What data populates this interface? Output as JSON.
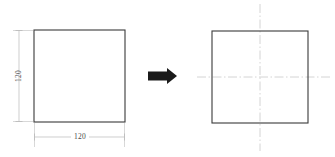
{
  "drawing": {
    "title": "Square plate dimension to centerline transformation",
    "colors": {
      "outline": "#3a3a3a",
      "dimension_line": "#b9b9b9",
      "extension_line": "#c7c7c7",
      "centerline": "#c9c9c9",
      "arrow": "#1a1a1a",
      "text": "#4a4a4a",
      "background": "#ffffff"
    },
    "left_view": {
      "name": "dimensioned-square",
      "shape": "square",
      "width_dimension": {
        "value": "120",
        "orientation": "horizontal",
        "position": "below"
      },
      "height_dimension": {
        "value": "120",
        "orientation": "vertical",
        "position": "left"
      }
    },
    "transform_arrow": {
      "name": "right-arrow",
      "direction": "right",
      "style": "solid-block"
    },
    "right_view": {
      "name": "centerline-square",
      "shape": "square",
      "centerlines": {
        "horizontal": true,
        "vertical": true,
        "style": "dash-dot"
      }
    }
  }
}
